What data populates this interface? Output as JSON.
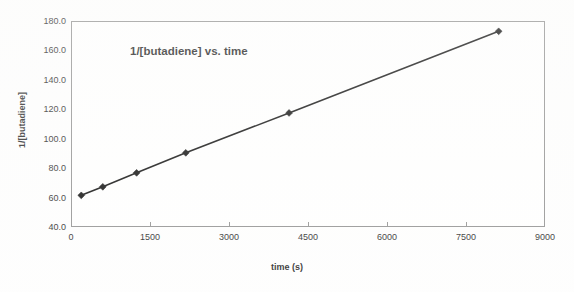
{
  "chart_data": {
    "type": "scatter",
    "title": "1/[butadiene] vs. time",
    "xlabel": "time (s)",
    "ylabel": "1/[butadiene]",
    "xlim": [
      0,
      9000
    ],
    "ylim": [
      40.0,
      180.0
    ],
    "grid": false,
    "legend": null,
    "x_ticks": [
      "0",
      "1500",
      "3000",
      "4500",
      "6000",
      "7500",
      "9000"
    ],
    "x_tick_values": [
      0,
      1500,
      3000,
      4500,
      6000,
      7500,
      9000
    ],
    "y_ticks": [
      "40.0",
      "60.0",
      "80.0",
      "100.0",
      "120.0",
      "140.0",
      "160.0",
      "180.0"
    ],
    "y_tick_values": [
      40.0,
      60.0,
      80.0,
      100.0,
      120.0,
      140.0,
      160.0,
      180.0
    ],
    "series": [
      {
        "name": "1/[butadiene]",
        "marker": "diamond",
        "color": "#000000",
        "x": [
          195,
          604,
          1246,
          2180,
          4140,
          8120
        ],
        "y": [
          61.5,
          67.3,
          76.8,
          90.4,
          117.5,
          173.0
        ]
      }
    ]
  },
  "style": {
    "frame_color": "#8c8c8c",
    "line_color": "#000000",
    "marker_color": "#000000",
    "text_color": "#1a1a1a",
    "plot_background": "#ffffff"
  }
}
